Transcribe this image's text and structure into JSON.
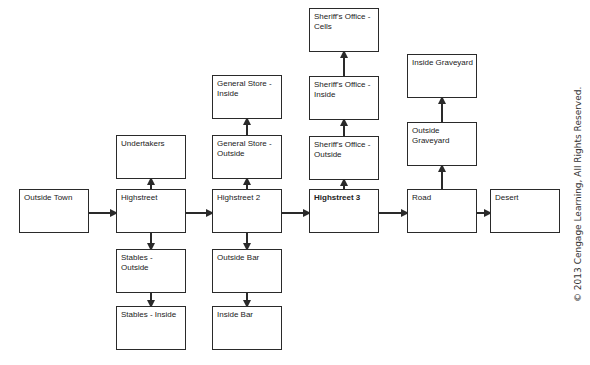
{
  "nodes": [
    {
      "id": "outside-town",
      "label": "Outside Town"
    },
    {
      "id": "highstreet",
      "label": "Highstreet"
    },
    {
      "id": "undertakers",
      "label": "Undertakers"
    },
    {
      "id": "stables-outside",
      "label": "Stables - Outside"
    },
    {
      "id": "stables-inside",
      "label": "Stables - Inside"
    },
    {
      "id": "highstreet-2",
      "label": "Highstreet 2"
    },
    {
      "id": "general-store-outside",
      "label": "General Store - Outside"
    },
    {
      "id": "general-store-inside",
      "label": "General Store - Inside"
    },
    {
      "id": "outside-bar",
      "label": "Outside Bar"
    },
    {
      "id": "inside-bar",
      "label": "Inside Bar"
    },
    {
      "id": "highstreet-3",
      "label": "Highstreet 3"
    },
    {
      "id": "sheriffs-office-outside",
      "label": "Sheriff's Office - Outside"
    },
    {
      "id": "sheriffs-office-inside",
      "label": "Sheriff's Office - Inside"
    },
    {
      "id": "sheriffs-office-cells",
      "label": "Sheriff's Office - Cells"
    },
    {
      "id": "road",
      "label": "Road"
    },
    {
      "id": "outside-graveyard",
      "label": "Outside Graveyard"
    },
    {
      "id": "inside-graveyard",
      "label": "Inside Graveyard"
    },
    {
      "id": "desert",
      "label": "Desert"
    }
  ],
  "edges": [
    {
      "from": "outside-town",
      "to": "highstreet"
    },
    {
      "from": "highstreet",
      "to": "undertakers"
    },
    {
      "from": "highstreet",
      "to": "stables-outside"
    },
    {
      "from": "stables-outside",
      "to": "stables-inside"
    },
    {
      "from": "highstreet",
      "to": "highstreet-2"
    },
    {
      "from": "highstreet-2",
      "to": "general-store-outside"
    },
    {
      "from": "general-store-outside",
      "to": "general-store-inside"
    },
    {
      "from": "highstreet-2",
      "to": "outside-bar"
    },
    {
      "from": "outside-bar",
      "to": "inside-bar"
    },
    {
      "from": "highstreet-2",
      "to": "highstreet-3"
    },
    {
      "from": "highstreet-3",
      "to": "sheriffs-office-outside"
    },
    {
      "from": "sheriffs-office-outside",
      "to": "sheriffs-office-inside"
    },
    {
      "from": "sheriffs-office-inside",
      "to": "sheriffs-office-cells"
    },
    {
      "from": "highstreet-3",
      "to": "road"
    },
    {
      "from": "road",
      "to": "outside-graveyard"
    },
    {
      "from": "outside-graveyard",
      "to": "inside-graveyard"
    },
    {
      "from": "road",
      "to": "desert"
    }
  ],
  "copyright": "© 2013 Cengage Learning, All Rights Reserved."
}
